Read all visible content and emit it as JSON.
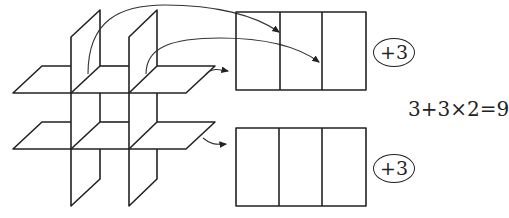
{
  "diagram": {
    "top_rect": {
      "parts": 3,
      "badge": "+3"
    },
    "bottom_rect": {
      "parts": 3,
      "badge": "+3"
    },
    "equation": "3+3×2=9",
    "colors": {
      "stroke": "#222222",
      "background": "#ffffff"
    }
  }
}
